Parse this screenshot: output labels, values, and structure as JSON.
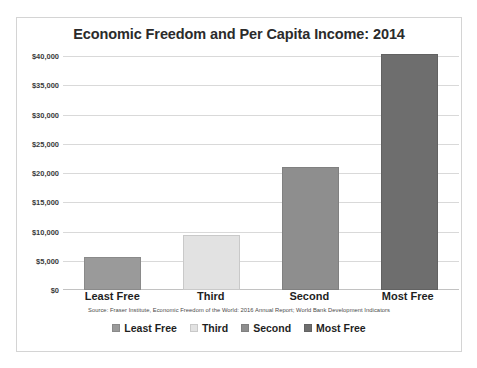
{
  "chart_data": {
    "type": "bar",
    "title": "Economic Freedom and Per Capita Income: 2014",
    "categories": [
      "Least Free",
      "Third",
      "Second",
      "Most Free"
    ],
    "values": [
      5700,
      9400,
      21100,
      40400
    ],
    "xlabel": "",
    "ylabel": "",
    "ylim": [
      0,
      40000
    ],
    "y_ticks": [
      {
        "value": 40000,
        "label": "$40,000"
      },
      {
        "value": 35000,
        "label": "$35,000"
      },
      {
        "value": 30000,
        "label": "$30,000"
      },
      {
        "value": 25000,
        "label": "$25,000"
      },
      {
        "value": 20000,
        "label": "$20,000"
      },
      {
        "value": 15000,
        "label": "$15,000"
      },
      {
        "value": 10000,
        "label": "$10,000"
      },
      {
        "value": 5000,
        "label": "$5,000"
      },
      {
        "value": 0,
        "label": "$0"
      }
    ],
    "bar_colors": [
      "#9a9a9a",
      "#e2e2e2",
      "#8e8e8e",
      "#6e6e6e"
    ],
    "bar_border_colors": [
      "#8a8a8a",
      "#c9c9c9",
      "#808080",
      "#626262"
    ],
    "grid": true,
    "legend_position": "bottom",
    "legend": [
      {
        "label": "Least Free",
        "color": "#9a9a9a"
      },
      {
        "label": "Third",
        "color": "#e2e2e2"
      },
      {
        "label": "Second",
        "color": "#8e8e8e"
      },
      {
        "label": "Most Free",
        "color": "#6e6e6e"
      }
    ],
    "source_note": "Source: Fraser Institute, Economic Freedom of the World: 2016 Annual Report; World Bank Development Indicators"
  }
}
